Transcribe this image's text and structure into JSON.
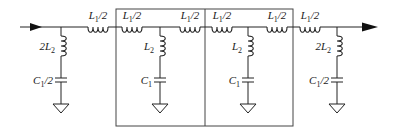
{
  "diagram": {
    "type": "circuit-schematic",
    "series_inductors": [
      {
        "label": "L1/2"
      },
      {
        "label": "L1/2"
      },
      {
        "label": "L1/2"
      },
      {
        "label": "L1/2"
      },
      {
        "label": "L1/2"
      },
      {
        "label": "L1/2"
      }
    ],
    "shunt_branches": [
      {
        "inductor": "2L2",
        "capacitor": "C1/2",
        "boxed": false
      },
      {
        "inductor": "L2",
        "capacitor": "C1",
        "boxed": true
      },
      {
        "inductor": "L2",
        "capacitor": "C1",
        "boxed": true
      },
      {
        "inductor": "2L2",
        "capacitor": "C1/2",
        "boxed": false
      }
    ],
    "unit_cells": 2,
    "input_arrow": "right-arrow-icon",
    "output_arrow": "right-arrow-icon"
  }
}
